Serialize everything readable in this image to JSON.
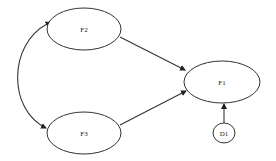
{
  "diagram": {
    "type": "path-diagram",
    "nodes": [
      {
        "id": "F2",
        "label": "F2",
        "shape": "ellipse",
        "cx": 84,
        "cy": 29,
        "rx": 37,
        "ry": 21
      },
      {
        "id": "F3",
        "label": "F3",
        "shape": "ellipse",
        "cx": 84,
        "cy": 133,
        "rx": 37,
        "ry": 21
      },
      {
        "id": "F1",
        "label": "F1",
        "shape": "ellipse",
        "cx": 222,
        "cy": 82,
        "rx": 38,
        "ry": 21
      },
      {
        "id": "D1",
        "label": "D1",
        "shape": "circle",
        "cx": 224,
        "cy": 133,
        "rx": 11,
        "ry": 10
      }
    ],
    "edges": [
      {
        "from": "F2",
        "to": "F1",
        "type": "directed"
      },
      {
        "from": "F3",
        "to": "F1",
        "type": "directed"
      },
      {
        "from": "D1",
        "to": "F1",
        "type": "directed"
      },
      {
        "from": "F2",
        "to": "F3",
        "type": "bidirectional-curved"
      }
    ]
  }
}
